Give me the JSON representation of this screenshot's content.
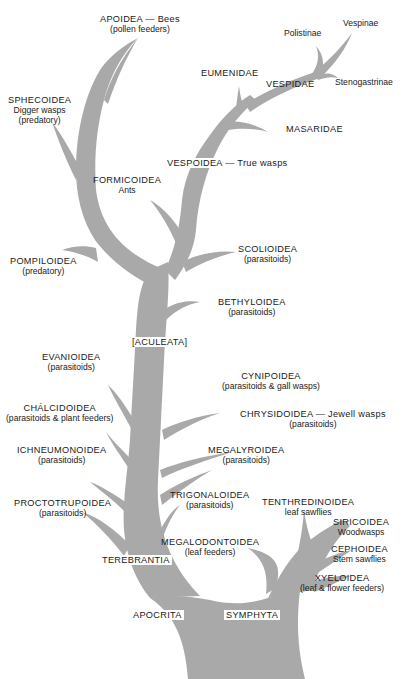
{
  "diagram": {
    "type": "phylogenetic-tree",
    "colors": {
      "branch": "#a9a9a9",
      "text": "#1a1a1a",
      "background": "#ffffff"
    },
    "nodes": {
      "apoidea": {
        "name": "APOIDEA — Bees",
        "note": "(pollen feeders)"
      },
      "sphecoidea": {
        "name": "SPHECOIDEA",
        "common": "Digger wasps",
        "note": "(predatory)"
      },
      "vespinae": {
        "name": "Vespinae"
      },
      "polistinae": {
        "name": "Polistinae"
      },
      "stenogastrinae": {
        "name": "Stenogastrinae"
      },
      "eumenidae": {
        "name": "EUMENIDAE"
      },
      "vespidae": {
        "name": "VESPIDAE"
      },
      "masaridae": {
        "name": "MASARIDAE"
      },
      "vespoidea": {
        "name": "VESPOIDEA — True wasps"
      },
      "formicoidea": {
        "name": "FORMICOIDEA",
        "common": "Ants"
      },
      "pompiloidea": {
        "name": "POMPILOIDEA",
        "note": "(predatory)"
      },
      "scolioidea": {
        "name": "SCOLIOIDEA",
        "note": "(parasitoids)"
      },
      "bethyloidea": {
        "name": "BETHYLOIDEA",
        "note": "(parasitoids)"
      },
      "aculeata": {
        "name": "[ACULEATA]"
      },
      "evanioidea": {
        "name": "EVANIOIDEA",
        "note": "(parasitoids)"
      },
      "cynipoidea": {
        "name": "CYNIPOIDEA",
        "note": "(parasitoids & gall wasps)"
      },
      "chalcidoidea": {
        "name": "CHÁLCIDOIDEA",
        "note": "(parasitoids & plant feeders)"
      },
      "chrysidoidea": {
        "name": "CHRYSIDOIDEA — Jewell wasps",
        "note": "(parasitoids)"
      },
      "ichneumonoidea": {
        "name": "ICHNEUMONOIDEA",
        "note": "(parasitoids)"
      },
      "megalyroidea": {
        "name": "MEGALYROIDEA",
        "note": "(parasitoids)"
      },
      "proctotrupoidea": {
        "name": "PROCTOTRUPOIDEA",
        "note": "(parasitoids)"
      },
      "trigonaloidea": {
        "name": "TRIGONALOIDEA",
        "note": "(parasitoids)"
      },
      "tenthredinoidea": {
        "name": "TENTHREDINOIDEA",
        "common": "leaf sawflies"
      },
      "siricoidea": {
        "name": "SIRICOIDEA",
        "common": "Woodwasps"
      },
      "megalodontoidea": {
        "name": "MEGALODONTOIDEA",
        "note": "(leaf feeders)"
      },
      "cephoidea": {
        "name": "CEPHOIDEA",
        "common": "Stem sawflies"
      },
      "terebrantia": {
        "name": "TEREBRANTIA"
      },
      "xyeloidea": {
        "name": "XYELOIDEA",
        "note": "(leaf & flower feeders)"
      },
      "apocrita": {
        "name": "APOCRITA"
      },
      "symphyta": {
        "name": "SYMPHYTA"
      }
    }
  }
}
